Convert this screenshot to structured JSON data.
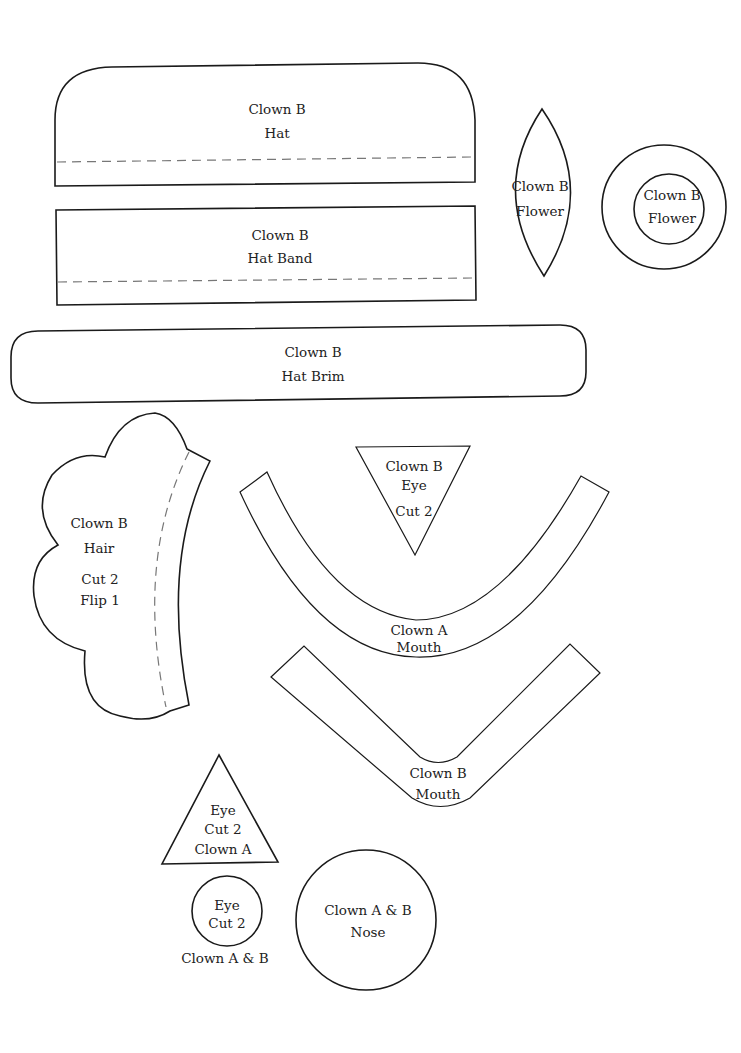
{
  "pieces": {
    "hat": {
      "line1": "Clown B",
      "line2": "Hat"
    },
    "hat_band": {
      "line1": "Clown B",
      "line2": "Hat Band"
    },
    "flower_petal": {
      "line1": "Clown B",
      "line2": "Flower"
    },
    "flower_circle": {
      "line1": "Clown B",
      "line2": "Flower"
    },
    "hat_brim": {
      "line1": "Clown B",
      "line2": "Hat Brim"
    },
    "hair": {
      "line1": "Clown B",
      "line2": "Hair",
      "line3": "Cut 2",
      "line4": "Flip 1"
    },
    "clown_b_eye": {
      "line1": "Clown B",
      "line2": "Eye",
      "line3": "Cut 2"
    },
    "clown_a_mouth": {
      "line1": "Clown A",
      "line2": "Mouth"
    },
    "clown_b_mouth": {
      "line1": "Clown B",
      "line2": "Mouth"
    },
    "clown_a_eye": {
      "line1": "Eye",
      "line2": "Cut 2",
      "line3": "Clown A"
    },
    "round_eye": {
      "line1": "Eye",
      "line2": "Cut 2",
      "caption": "Clown A & B"
    },
    "nose": {
      "line1": "Clown A & B",
      "line2": "Nose"
    }
  },
  "colors": {
    "outline": "#1a1a1a",
    "fold_line": "#777777",
    "background": "#ffffff"
  }
}
